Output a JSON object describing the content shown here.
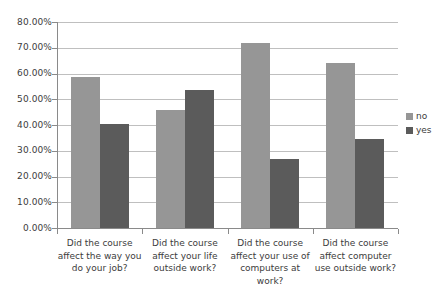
{
  "chart_data": {
    "type": "bar",
    "title": "",
    "subtitle": "",
    "xlabel": "",
    "ylabel": "",
    "ylim": [
      0,
      80
    ],
    "grid": true,
    "legend_position": "right",
    "y_tick_labels": [
      "80.00%",
      "70.00%",
      "60.00%",
      "50.00%",
      "40.00%",
      "30.00%",
      "20.00%",
      "10.00%",
      "0.00%"
    ],
    "y_tick_values": [
      80,
      70,
      60,
      50,
      40,
      30,
      20,
      10,
      0
    ],
    "categories": [
      "Did the course\naffect the way you\ndo your job?",
      "Did the course\naffect your life\noutside work?",
      "Did the course\naffect your use of\ncomputers at\nwork?",
      "Did the course\naffect computer\nuse outside work?"
    ],
    "series": [
      {
        "name": "no",
        "color": "#969696",
        "values": [
          58.8,
          45.8,
          71.8,
          64.0
        ]
      },
      {
        "name": "yes",
        "color": "#5b5b5b",
        "values": [
          40.3,
          53.5,
          26.9,
          34.5
        ]
      }
    ]
  },
  "legend": {
    "items": [
      {
        "label": "no"
      },
      {
        "label": "yes"
      }
    ]
  },
  "colors": {
    "series_no": "#969696",
    "series_yes": "#5b5b5b",
    "gridline": "#bfbfbf",
    "axis": "#8a8a8a",
    "text": "#3c3c3c",
    "background": "#ffffff"
  }
}
